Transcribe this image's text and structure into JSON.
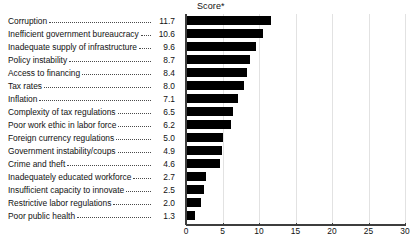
{
  "chart_data": {
    "type": "bar",
    "orientation": "horizontal",
    "title": "Score*",
    "xlabel": "",
    "ylabel": "",
    "xlim": [
      0,
      30
    ],
    "xticks": [
      0,
      5,
      10,
      15,
      20,
      25,
      30
    ],
    "grid": true,
    "legend": false,
    "bar_color": "#000000",
    "categories": [
      "Corruption",
      "Inefficient government bureaucracy",
      "Inadequate supply of infrastructure",
      "Policy instability",
      "Access to financing",
      "Tax rates",
      "Inflation",
      "Complexity of tax regulations",
      "Poor work ethic in labor force",
      "Foreign currency regulations",
      "Government instability/coups",
      "Crime and theft",
      "Inadequately educated workforce",
      "Insufficient capacity to innovate",
      "Restrictive labor regulations",
      "Poor public health"
    ],
    "values": [
      11.7,
      10.6,
      9.6,
      8.7,
      8.4,
      8.0,
      7.1,
      6.5,
      6.2,
      5.0,
      4.9,
      4.6,
      2.7,
      2.5,
      2.0,
      1.3
    ],
    "value_labels": [
      "11.7",
      "10.6",
      "9.6",
      "8.7",
      "8.4",
      "8.0",
      "7.1",
      "6.5",
      "6.2",
      "5.0",
      "4.9",
      "4.6",
      "2.7",
      "2.5",
      "2.0",
      "1.3"
    ]
  }
}
